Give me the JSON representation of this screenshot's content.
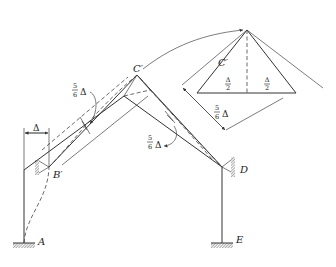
{
  "diagram": {
    "type": "structural-frame-deflection",
    "labels": {
      "A": "A",
      "B_prime": "B′",
      "C_prime_main": "C′",
      "C_prime_detail": "C′",
      "D": "D",
      "E": "E"
    },
    "dimensions": {
      "delta": "Δ",
      "five_sixths_left": {
        "num": "5",
        "den": "6",
        "sym": "Δ"
      },
      "five_sixths_right": {
        "num": "5",
        "den": "6",
        "sym": "Δ"
      },
      "five_sixths_detail": {
        "num": "5",
        "den": "6",
        "sym": "Δ"
      },
      "half_left": {
        "num": "Δ",
        "den": "2"
      },
      "half_right": {
        "num": "Δ",
        "den": "2"
      }
    },
    "colors": {
      "line": "#333333",
      "hatch": "#555555",
      "background": "#ffffff"
    }
  }
}
